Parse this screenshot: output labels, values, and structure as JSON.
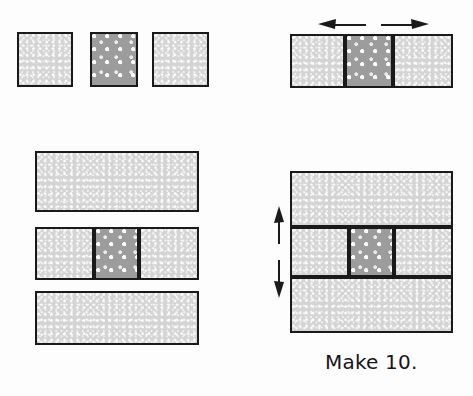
{
  "figure": {
    "caption": "Make 10.",
    "fabrics": {
      "light_label": "light dotted fabric",
      "light_color": "#d4d4d4",
      "dark_label": "dark dotted fabric",
      "dark_color": "#9c9c9c",
      "outline_color": "#1a1a1a"
    }
  },
  "steps": {
    "step1": {
      "name": "three separate squares",
      "pieces": [
        {
          "fabric": "light",
          "x": 17,
          "y": 32,
          "w": 56,
          "h": 55
        },
        {
          "fabric": "dark",
          "x": 90,
          "y": 32,
          "w": 48,
          "h": 55
        },
        {
          "fabric": "light",
          "x": 152,
          "y": 32,
          "w": 57,
          "h": 55
        }
      ]
    },
    "step2": {
      "name": "sewn center row with pressing arrows",
      "pieces": [
        {
          "fabric": "light",
          "x": 290,
          "y": 34,
          "w": 55,
          "h": 54
        },
        {
          "fabric": "dark",
          "x": 345,
          "y": 34,
          "w": 48,
          "h": 54
        },
        {
          "fabric": "light",
          "x": 393,
          "y": 34,
          "w": 60,
          "h": 54
        }
      ],
      "arrows": [
        {
          "name": "press-left-arrow",
          "direction": "left",
          "x1": 361,
          "y1": 24,
          "x2": 323,
          "y2": 24
        },
        {
          "name": "press-right-arrow",
          "direction": "right",
          "x1": 384,
          "y1": 24,
          "x2": 422,
          "y2": 24
        }
      ]
    },
    "step3": {
      "name": "three rows laid out",
      "pieces": [
        {
          "fabric": "light",
          "x": 35,
          "y": 151,
          "w": 164,
          "h": 61
        },
        {
          "fabric": "light",
          "x": 35,
          "y": 227,
          "w": 59,
          "h": 53
        },
        {
          "fabric": "dark",
          "x": 94,
          "y": 227,
          "w": 45,
          "h": 53
        },
        {
          "fabric": "light",
          "x": 139,
          "y": 227,
          "w": 60,
          "h": 53
        },
        {
          "fabric": "light",
          "x": 35,
          "y": 291,
          "w": 164,
          "h": 54
        }
      ]
    },
    "step4": {
      "name": "assembled block with pressing arrows",
      "pieces": [
        {
          "fabric": "light",
          "x": 290,
          "y": 171,
          "w": 163,
          "h": 56
        },
        {
          "fabric": "light",
          "x": 290,
          "y": 227,
          "w": 59,
          "h": 50
        },
        {
          "fabric": "dark",
          "x": 349,
          "y": 227,
          "w": 45,
          "h": 50
        },
        {
          "fabric": "light",
          "x": 394,
          "y": 227,
          "w": 59,
          "h": 50
        },
        {
          "fabric": "light",
          "x": 290,
          "y": 277,
          "w": 163,
          "h": 56
        }
      ],
      "arrows": [
        {
          "name": "press-up-arrow",
          "direction": "up",
          "x1": 279,
          "y1": 239,
          "x2": 279,
          "y2": 208
        },
        {
          "name": "press-down-arrow",
          "direction": "down",
          "x1": 279,
          "y1": 265,
          "x2": 279,
          "y2": 296
        }
      ]
    }
  },
  "caption_position": {
    "x": 325,
    "y": 350
  }
}
